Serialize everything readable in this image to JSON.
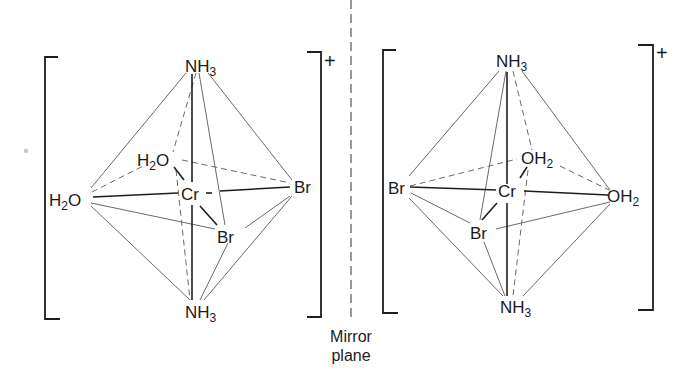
{
  "figure": {
    "type": "octahedral coordination complex enantiomers",
    "charge": "+",
    "mirror_label_line1": "Mirror",
    "mirror_label_line2": "plane"
  },
  "left_complex": {
    "metal": "Cr",
    "ligands": {
      "top": {
        "main": "NH",
        "sub": "3"
      },
      "bottom": {
        "main": "NH",
        "sub": "3"
      },
      "left": {
        "pre": "H",
        "sub": "2",
        "post": "O"
      },
      "back": {
        "pre": "H",
        "sub": "2",
        "post": "O"
      },
      "right": {
        "main": "Br"
      },
      "front": {
        "main": "Br"
      }
    },
    "charge": "+"
  },
  "right_complex": {
    "metal": "Cr",
    "ligands": {
      "top": {
        "main": "NH",
        "sub": "3"
      },
      "bottom": {
        "main": "NH",
        "sub": "3"
      },
      "left": {
        "main": "Br"
      },
      "back": {
        "main": "OH",
        "sub": "2"
      },
      "right": {
        "main": "OH",
        "sub": "2"
      },
      "front": {
        "main": "Br"
      }
    },
    "charge": "+"
  }
}
